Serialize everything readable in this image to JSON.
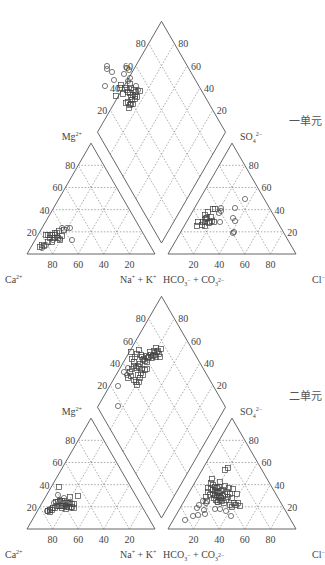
{
  "figure": {
    "panels": [
      {
        "id": "unit-1",
        "label": "一单元",
        "base_y": 254,
        "circles_diamond": [
          [
            107,
            66
          ],
          [
            107,
            69
          ],
          [
            112,
            72
          ],
          [
            127,
            68
          ],
          [
            129,
            70
          ],
          [
            124,
            74
          ],
          [
            130,
            78
          ],
          [
            128,
            81
          ],
          [
            114,
            80
          ],
          [
            136,
            86
          ],
          [
            138,
            90
          ],
          [
            105,
            86
          ]
        ],
        "squares_diamond": [
          [
            121,
            85
          ],
          [
            120,
            88
          ],
          [
            130,
            84
          ],
          [
            131,
            88
          ],
          [
            125,
            88
          ],
          [
            127,
            90
          ],
          [
            116,
            96
          ],
          [
            123,
            94
          ],
          [
            128,
            92
          ],
          [
            134,
            90
          ],
          [
            140,
            91
          ],
          [
            131,
            97
          ],
          [
            132,
            100
          ],
          [
            128,
            102
          ],
          [
            130,
            93
          ],
          [
            133,
            95
          ],
          [
            135,
            99
          ],
          [
            135,
            96
          ],
          [
            136,
            92
          ],
          [
            133,
            104
          ],
          [
            130,
            105
          ],
          [
            126,
            103
          ],
          [
            129,
            108
          ],
          [
            131,
            104
          ],
          [
            137,
            97
          ]
        ],
        "circles_left": [
          [
            67,
            228
          ],
          [
            70,
            228
          ],
          [
            62,
            228
          ],
          [
            72,
            240
          ],
          [
            60,
            239
          ],
          [
            46,
            245
          ],
          [
            42,
            248
          ],
          [
            53,
            240
          ],
          [
            57,
            237
          ]
        ],
        "squares_left": [
          [
            46,
            235
          ],
          [
            48,
            235
          ],
          [
            50,
            235
          ],
          [
            52,
            235
          ],
          [
            55,
            235
          ],
          [
            57,
            233
          ],
          [
            59,
            231
          ],
          [
            50,
            238
          ],
          [
            54,
            238
          ],
          [
            58,
            238
          ],
          [
            48,
            242
          ],
          [
            52,
            242
          ],
          [
            44,
            246
          ],
          [
            40,
            247
          ],
          [
            42,
            245
          ],
          [
            62,
            236
          ],
          [
            60,
            240
          ],
          [
            55,
            233
          ],
          [
            64,
            230
          ]
        ],
        "circles_right": [
          [
            221,
            208
          ],
          [
            221,
            211
          ],
          [
            220,
            222
          ],
          [
            235,
            208
          ],
          [
            233,
            218
          ],
          [
            235,
            221
          ],
          [
            234,
            232
          ],
          [
            233,
            233
          ],
          [
            245,
            199
          ],
          [
            219,
            213
          ],
          [
            205,
            218
          ]
        ],
        "squares_right": [
          [
            213,
            209
          ],
          [
            215,
            209
          ],
          [
            208,
            212
          ],
          [
            205,
            215
          ],
          [
            207,
            218
          ],
          [
            203,
            222
          ],
          [
            205,
            222
          ],
          [
            210,
            222
          ],
          [
            212,
            221
          ],
          [
            197,
            226
          ],
          [
            198,
            222
          ],
          [
            202,
            225
          ],
          [
            214,
            222
          ],
          [
            211,
            217
          ],
          [
            205,
            226
          ],
          [
            209,
            223
          ],
          [
            206,
            219
          ]
        ]
      },
      {
        "id": "unit-2",
        "label": "二单元",
        "base_y": 529,
        "circles_diamond": [
          [
            118,
            386
          ],
          [
            118,
            406
          ],
          [
            124,
            372
          ],
          [
            127,
            375
          ],
          [
            128,
            368
          ]
        ],
        "squares_diamond": [
          [
            131,
            352
          ],
          [
            132,
            359
          ],
          [
            135,
            357
          ],
          [
            137,
            354
          ],
          [
            134,
            362
          ],
          [
            139,
            350
          ],
          [
            141,
            355
          ],
          [
            142,
            357
          ],
          [
            143,
            360
          ],
          [
            144,
            359
          ],
          [
            145,
            361
          ],
          [
            146,
            356
          ],
          [
            148,
            358
          ],
          [
            150,
            352
          ],
          [
            151,
            355
          ],
          [
            152,
            358
          ],
          [
            155,
            355
          ],
          [
            156,
            357
          ],
          [
            158,
            351
          ],
          [
            159,
            354
          ],
          [
            160,
            357
          ],
          [
            157,
            352
          ],
          [
            154,
            351
          ],
          [
            153,
            356
          ],
          [
            149,
            357
          ],
          [
            147,
            362
          ],
          [
            140,
            364
          ],
          [
            138,
            366
          ],
          [
            136,
            368
          ],
          [
            139,
            367
          ],
          [
            142,
            369
          ],
          [
            141,
            373
          ],
          [
            138,
            375
          ],
          [
            140,
            378
          ],
          [
            139,
            382
          ],
          [
            137,
            385
          ],
          [
            143,
            375
          ],
          [
            145,
            370
          ],
          [
            147,
            369
          ],
          [
            156,
            348
          ],
          [
            161,
            349
          ],
          [
            134,
            366
          ],
          [
            132,
            369
          ],
          [
            130,
            372
          ],
          [
            128,
            378
          ],
          [
            131,
            376
          ],
          [
            134,
            380
          ],
          [
            136,
            382
          ]
        ],
        "circles_left": [
          [
            54,
            503
          ],
          [
            58,
            495
          ],
          [
            60,
            500
          ],
          [
            64,
            498
          ],
          [
            71,
            508
          ],
          [
            66,
            505
          ],
          [
            50,
            509
          ],
          [
            47,
            511
          ]
        ],
        "squares_left": [
          [
            59,
            487
          ],
          [
            78,
            496
          ],
          [
            70,
            497
          ],
          [
            56,
            502
          ],
          [
            58,
            502
          ],
          [
            60,
            501
          ],
          [
            62,
            501
          ],
          [
            64,
            501
          ],
          [
            66,
            503
          ],
          [
            68,
            503
          ],
          [
            70,
            503
          ],
          [
            72,
            504
          ],
          [
            74,
            504
          ],
          [
            57,
            506
          ],
          [
            59,
            506
          ],
          [
            61,
            506
          ],
          [
            63,
            506
          ],
          [
            65,
            506
          ],
          [
            67,
            507
          ],
          [
            69,
            507
          ],
          [
            53,
            508
          ],
          [
            55,
            508
          ],
          [
            50,
            510
          ],
          [
            52,
            510
          ],
          [
            48,
            511
          ],
          [
            50,
            512
          ],
          [
            72,
            507
          ],
          [
            74,
            508
          ],
          [
            66,
            509
          ],
          [
            62,
            508
          ]
        ],
        "circles_right": [
          [
            185,
            520
          ],
          [
            193,
            516
          ],
          [
            198,
            515
          ],
          [
            197,
            508
          ],
          [
            205,
            514
          ],
          [
            204,
            510
          ],
          [
            215,
            509
          ],
          [
            220,
            509
          ],
          [
            226,
            511
          ],
          [
            231,
            516
          ],
          [
            199,
            505
          ],
          [
            206,
            503
          ],
          [
            203,
            501
          ],
          [
            217,
            502
          ],
          [
            221,
            497
          ]
        ],
        "squares_right": [
          [
            225,
            470
          ],
          [
            228,
            468
          ],
          [
            211,
            483
          ],
          [
            213,
            485
          ],
          [
            215,
            487
          ],
          [
            217,
            488
          ],
          [
            219,
            487
          ],
          [
            211,
            489
          ],
          [
            213,
            490
          ],
          [
            215,
            491
          ],
          [
            217,
            492
          ],
          [
            219,
            493
          ],
          [
            221,
            491
          ],
          [
            223,
            490
          ],
          [
            213,
            494
          ],
          [
            215,
            495
          ],
          [
            217,
            496
          ],
          [
            219,
            497
          ],
          [
            221,
            498
          ],
          [
            223,
            496
          ],
          [
            225,
            494
          ],
          [
            227,
            492
          ],
          [
            214,
            498
          ],
          [
            216,
            500
          ],
          [
            218,
            502
          ],
          [
            220,
            500
          ],
          [
            222,
            501
          ],
          [
            224,
            503
          ],
          [
            226,
            500
          ],
          [
            228,
            497
          ],
          [
            230,
            494
          ],
          [
            232,
            498
          ],
          [
            234,
            503
          ],
          [
            236,
            505
          ],
          [
            238,
            503
          ],
          [
            240,
            506
          ],
          [
            232,
            507
          ],
          [
            230,
            505
          ],
          [
            210,
            495
          ],
          [
            208,
            492
          ],
          [
            206,
            497
          ],
          [
            207,
            501
          ],
          [
            225,
            486
          ],
          [
            229,
            488
          ],
          [
            233,
            489
          ],
          [
            237,
            494
          ],
          [
            208,
            488
          ],
          [
            212,
            479
          ],
          [
            220,
            482
          ]
        ]
      }
    ],
    "tick_values": [
      "20",
      "40",
      "60",
      "80"
    ],
    "ions": {
      "cation_apex": "Mg",
      "cation_apex_charge": "2+",
      "cation_left": "Ca",
      "cation_left_charge": "2+",
      "cation_right": "Na",
      "cation_right_plus": "+",
      "cation_right_k": "+ K",
      "anion_apex": "SO",
      "anion_apex_sub": "4",
      "anion_apex_charge": "2−",
      "anion_left": "HCO",
      "anion_left_sub": "3",
      "anion_left_charge": "−",
      "anion_left_co": "+ CO",
      "anion_left_co_sub": "3",
      "anion_left_co_charge": "2−",
      "anion_right": "Cl",
      "anion_right_charge": "−"
    },
    "markers": {
      "circle": "sample-circle",
      "square": "sample-square"
    }
  }
}
